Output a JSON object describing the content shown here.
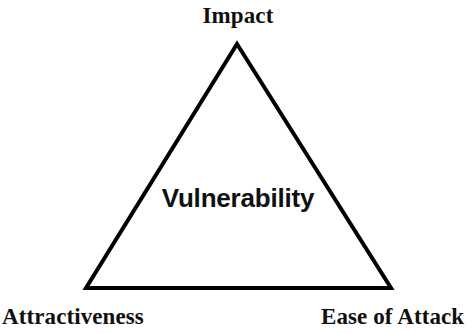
{
  "diagram": {
    "type": "triangle-concept-diagram",
    "center_label": "Vulnerability",
    "background_color": "#ffffff",
    "stroke_color": "#000000",
    "text_color": "#101010",
    "stroke_width": 4,
    "vertices": [
      {
        "id": "apex",
        "label": "Impact",
        "x": 237,
        "y": 44
      },
      {
        "id": "bottom-left",
        "label": "Attractiveness",
        "x": 86,
        "y": 288
      },
      {
        "id": "bottom-right",
        "label": "Ease of Attack",
        "x": 391,
        "y": 288
      }
    ],
    "labels": {
      "impact": "Impact",
      "attractiveness": "Attractiveness",
      "ease_of_attack": "Ease of Attack",
      "vulnerability": "Vulnerability"
    }
  }
}
